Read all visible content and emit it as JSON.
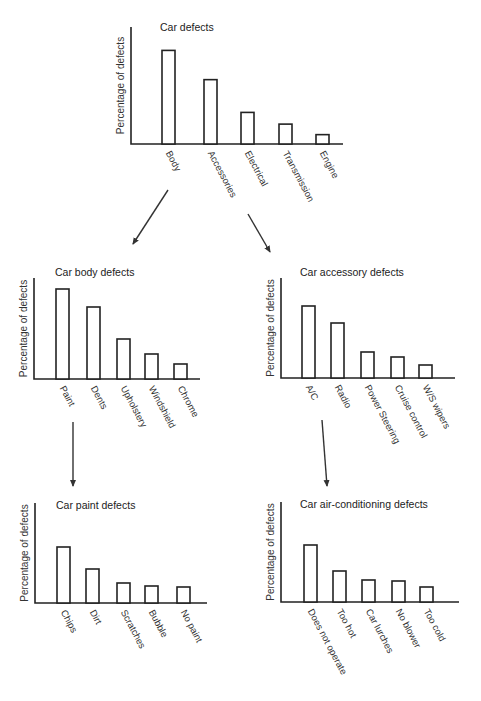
{
  "chart_data": [
    {
      "id": "car",
      "type": "bar",
      "title": "Car defects",
      "xlabel": "",
      "ylabel": "Percentage of defects",
      "categories": [
        "Body",
        "Accessories",
        "Electrical",
        "Transmission",
        "Engine"
      ],
      "values": [
        80,
        55,
        27,
        17,
        8
      ],
      "ylim": [
        0,
        100
      ],
      "grid": false,
      "legend": null
    },
    {
      "id": "body",
      "type": "bar",
      "title": "Car body defects",
      "xlabel": "",
      "ylabel": "Percentage of defects",
      "categories": [
        "Paint",
        "Dents",
        "Upholstery",
        "Windshield",
        "Chrome"
      ],
      "values": [
        90,
        72,
        40,
        25,
        15
      ],
      "ylim": [
        0,
        100
      ],
      "grid": false,
      "legend": null
    },
    {
      "id": "accessory",
      "type": "bar",
      "title": "Car accessory defects",
      "xlabel": "",
      "ylabel": "Percentage of defects",
      "categories": [
        "A/C",
        "Radio",
        "Power Steering",
        "Cruise control",
        "W/S wipers"
      ],
      "values": [
        72,
        55,
        26,
        21,
        13
      ],
      "ylim": [
        0,
        100
      ],
      "grid": false,
      "legend": null
    },
    {
      "id": "paint",
      "type": "bar",
      "title": "Car paint defects",
      "xlabel": "",
      "ylabel": "Percentage of defects",
      "categories": [
        "Chips",
        "Dirt",
        "Scratches",
        "Bubble",
        "No paint"
      ],
      "values": [
        56,
        34,
        20,
        17,
        16
      ],
      "ylim": [
        0,
        100
      ],
      "grid": false,
      "legend": null
    },
    {
      "id": "airconditioning",
      "type": "bar",
      "title": "Car air-conditioning defects",
      "xlabel": "",
      "ylabel": "Percentage of defects",
      "categories": [
        "Does not operate",
        "Too hot",
        "Car lurches",
        "No blower",
        "Too cold"
      ],
      "values": [
        57,
        31,
        22,
        21,
        15
      ],
      "ylim": [
        0,
        100
      ],
      "grid": false,
      "legend": null
    }
  ],
  "arrows": [
    {
      "from": "Body",
      "to": "Car body defects"
    },
    {
      "from": "Accessories",
      "to": "Car accessory defects"
    },
    {
      "from": "Paint",
      "to": "Car paint defects"
    },
    {
      "from": "A/C",
      "to": "Car air-conditioning defects"
    }
  ]
}
